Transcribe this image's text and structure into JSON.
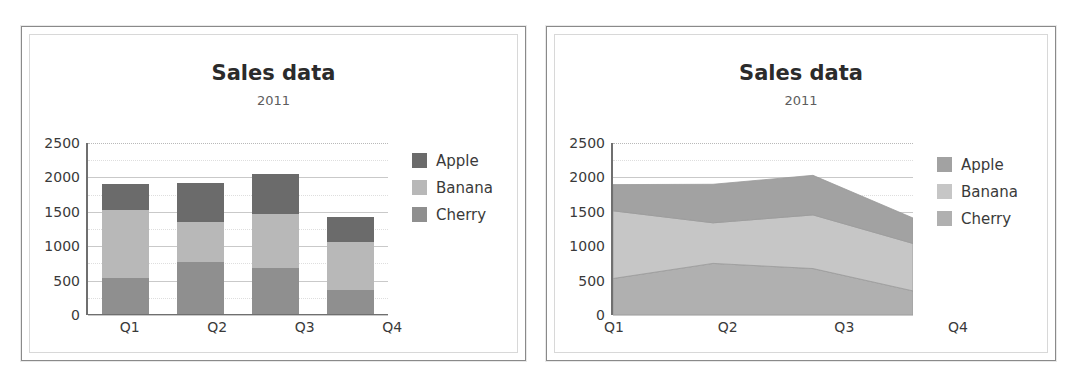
{
  "charts": [
    {
      "id": "bar-chart",
      "title": "Sales data",
      "subtitle": "2011"
    },
    {
      "id": "area-chart",
      "title": "Sales data",
      "subtitle": "2011"
    }
  ],
  "legend": {
    "items": [
      {
        "label": "Apple",
        "color": "#6b6b6b"
      },
      {
        "label": "Banana",
        "color": "#b8b8b8"
      },
      {
        "label": "Cherry",
        "color": "#8f8f8f"
      }
    ],
    "items_area": [
      {
        "label": "Apple",
        "color": "#a2a2a2"
      },
      {
        "label": "Banana",
        "color": "#c6c6c6"
      },
      {
        "label": "Cherry",
        "color": "#b0b0b0"
      }
    ]
  },
  "chart_data": [
    {
      "type": "bar",
      "subtype": "stacked-column",
      "title": "Sales data",
      "subtitle": "2011",
      "xlabel": "",
      "ylabel": "",
      "categories": [
        "Q1",
        "Q2",
        "Q3",
        "Q4"
      ],
      "yticks": [
        0,
        500,
        1000,
        1500,
        2000,
        2500
      ],
      "ylim": [
        0,
        2500
      ],
      "grid": true,
      "legend_position": "right",
      "series": [
        {
          "name": "Apple",
          "values": [
            380,
            560,
            575,
            370
          ],
          "color": "#6b6b6b"
        },
        {
          "name": "Banana",
          "values": [
            985,
            590,
            780,
            690
          ],
          "color": "#b8b8b8"
        },
        {
          "name": "Cherry",
          "values": [
            530,
            750,
            675,
            350
          ],
          "color": "#8f8f8f"
        }
      ],
      "stack_order": [
        "Cherry",
        "Banana",
        "Apple"
      ],
      "totals": [
        1895,
        1900,
        2030,
        1410
      ]
    },
    {
      "type": "area",
      "subtype": "stacked-area",
      "title": "Sales data",
      "subtitle": "2011",
      "xlabel": "",
      "ylabel": "",
      "categories": [
        "Q1",
        "Q2",
        "Q3",
        "Q4"
      ],
      "yticks": [
        0,
        500,
        1000,
        1500,
        2000,
        2500
      ],
      "ylim": [
        0,
        2500
      ],
      "grid": true,
      "legend_position": "right",
      "series": [
        {
          "name": "Apple",
          "values": [
            380,
            560,
            575,
            370
          ],
          "color": "#a2a2a2"
        },
        {
          "name": "Banana",
          "values": [
            985,
            590,
            780,
            690
          ],
          "color": "#c6c6c6"
        },
        {
          "name": "Cherry",
          "values": [
            530,
            750,
            675,
            350
          ],
          "color": "#b0b0b0"
        }
      ],
      "stack_order": [
        "Cherry",
        "Banana",
        "Apple"
      ],
      "totals": [
        1895,
        1900,
        2030,
        1410
      ]
    }
  ]
}
